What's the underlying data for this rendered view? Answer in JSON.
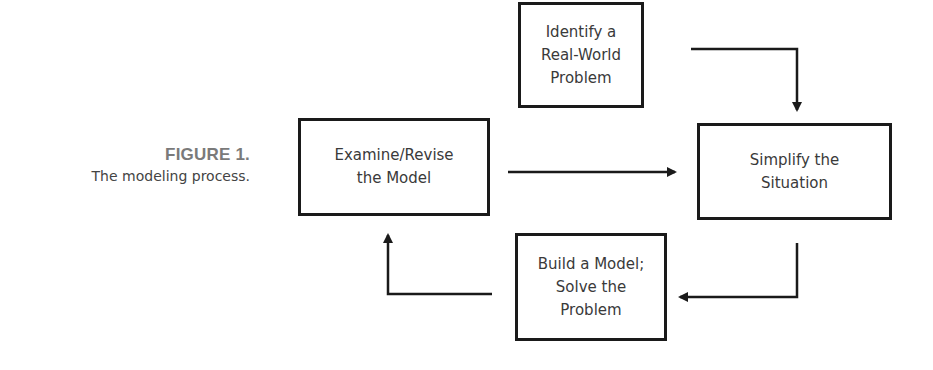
{
  "caption": {
    "figure_number": "FIGURE 1.",
    "text": "The modeling process."
  },
  "nodes": [
    {
      "id": "identify",
      "label": "Identify a\nReal-World\nProblem"
    },
    {
      "id": "simplify",
      "label": "Simplify the\nSituation"
    },
    {
      "id": "build",
      "label": "Build a Model;\nSolve the\nProblem"
    },
    {
      "id": "examine",
      "label": "Examine/Revise\nthe Model"
    }
  ],
  "edges": [
    {
      "from": "identify",
      "to": "simplify"
    },
    {
      "from": "simplify",
      "to": "build"
    },
    {
      "from": "build",
      "to": "examine"
    },
    {
      "from": "examine",
      "to": "simplify"
    }
  ],
  "colors": {
    "stroke": "#1a1a1a",
    "text": "#3a3a3a",
    "caption_number": "#7a7a7a"
  }
}
